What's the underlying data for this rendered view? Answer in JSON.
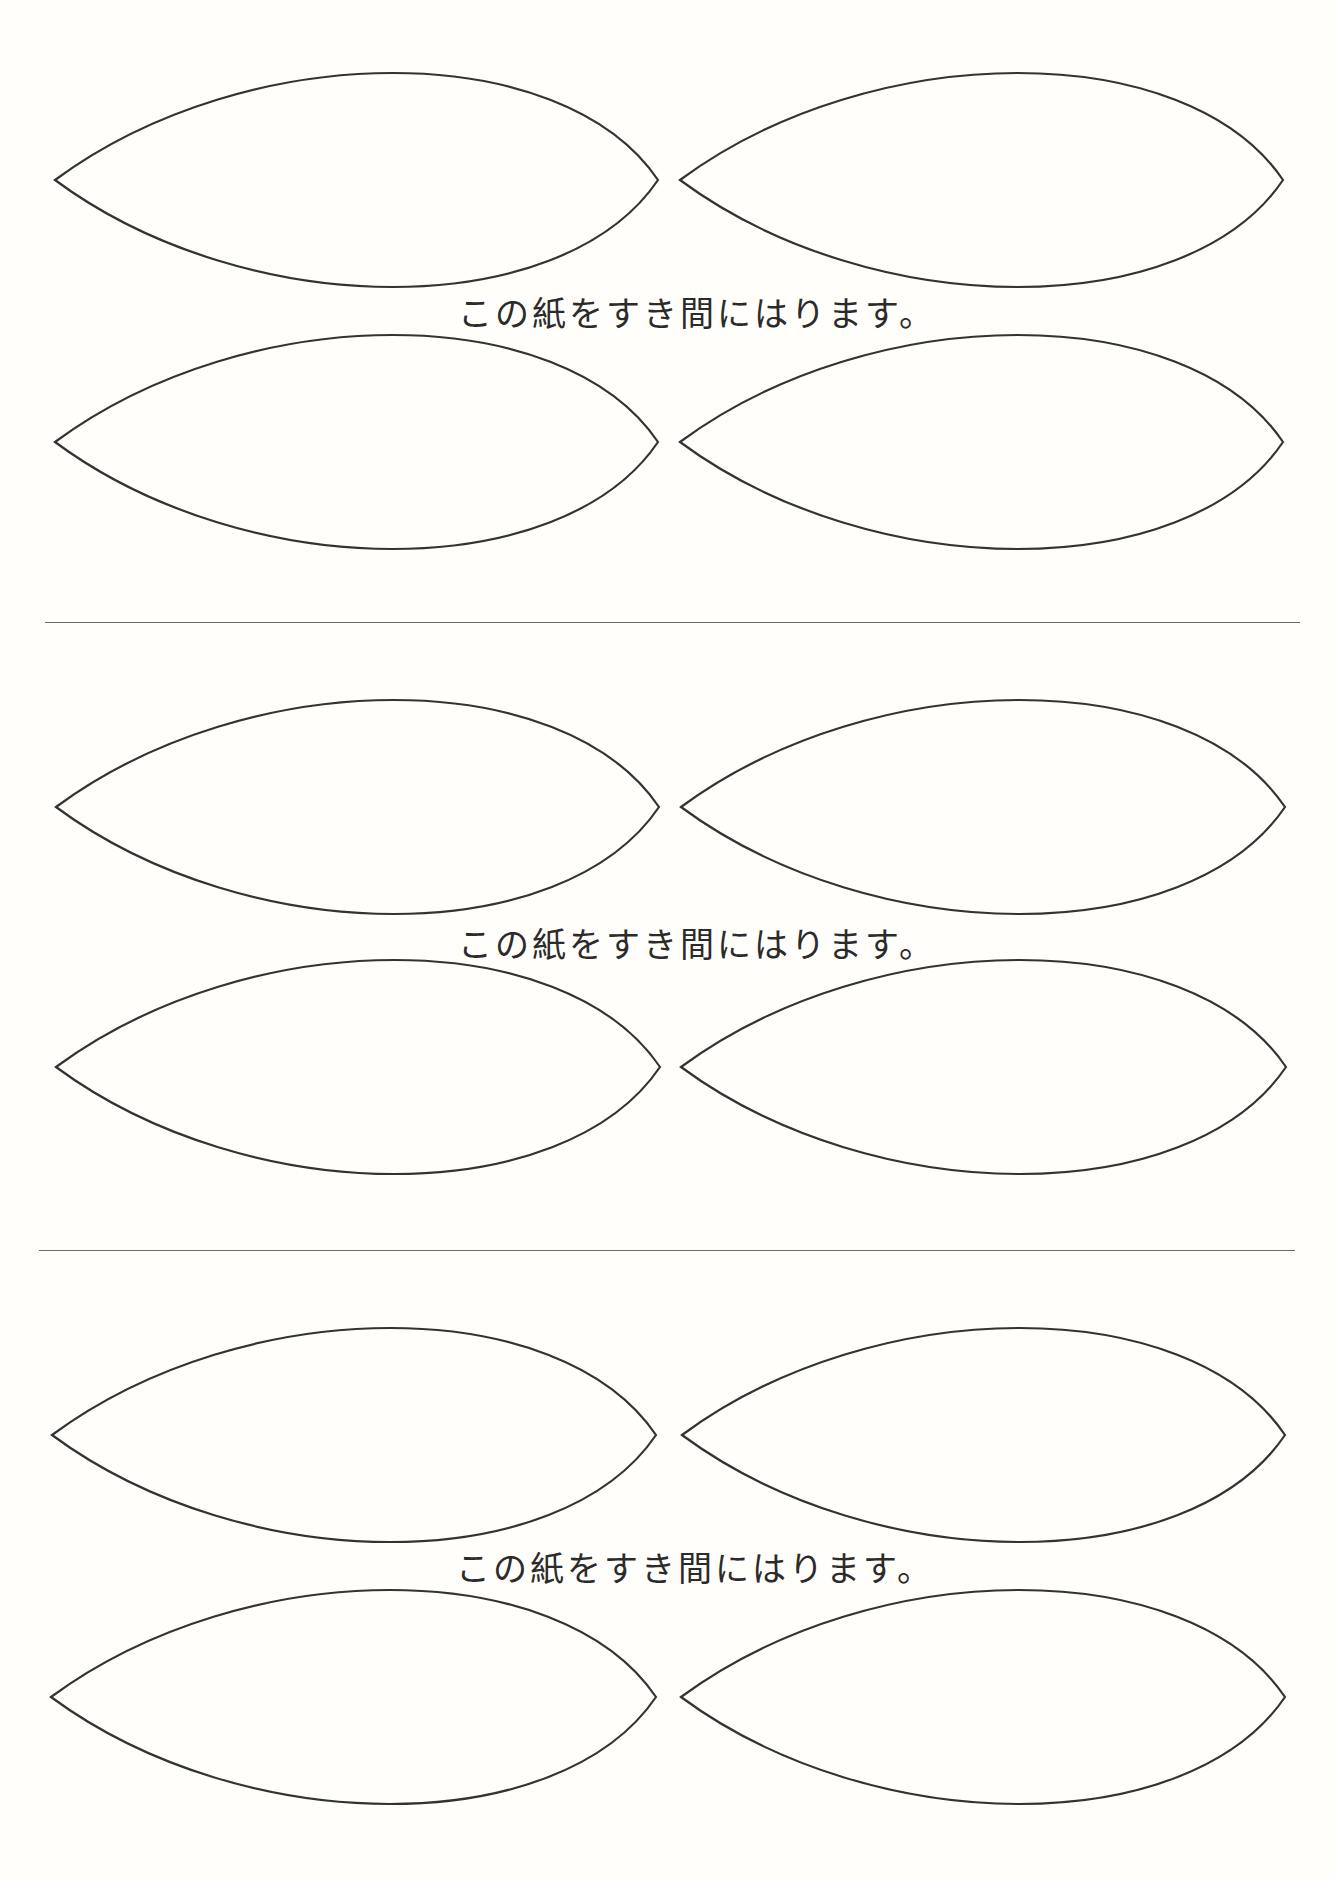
{
  "page": {
    "background": "#fffefa",
    "stroke_color": "#333333",
    "divider_color": "#6a6a6a"
  },
  "leaf_shape": {
    "width": 603,
    "half_height": 107,
    "peak_offset_ratio": 0.56
  },
  "sections": [
    {
      "caption": "この紙をすき間にはります。",
      "caption_x": 458,
      "caption_y": 296,
      "rows": [
        {
          "tip_y": 180,
          "leaves": [
            {
              "x0": 55,
              "x1": 658
            },
            {
              "x0": 680,
              "x1": 1283
            }
          ]
        },
        {
          "tip_y": 442,
          "leaves": [
            {
              "x0": 55,
              "x1": 658
            },
            {
              "x0": 680,
              "x1": 1283
            }
          ]
        }
      ]
    },
    {
      "caption": "この紙をすき間にはります。",
      "caption_x": 458,
      "caption_y": 927,
      "rows": [
        {
          "tip_y": 807,
          "leaves": [
            {
              "x0": 56,
              "x1": 659
            },
            {
              "x0": 681,
              "x1": 1285
            }
          ]
        },
        {
          "tip_y": 1067,
          "leaves": [
            {
              "x0": 56,
              "x1": 660
            },
            {
              "x0": 681,
              "x1": 1286
            }
          ]
        }
      ]
    },
    {
      "caption": "この紙をすき間にはります。",
      "caption_x": 456,
      "caption_y": 1551,
      "rows": [
        {
          "tip_y": 1435,
          "leaves": [
            {
              "x0": 52,
              "x1": 656
            },
            {
              "x0": 682,
              "x1": 1285
            }
          ]
        },
        {
          "tip_y": 1697,
          "leaves": [
            {
              "x0": 51,
              "x1": 656
            },
            {
              "x0": 681,
              "x1": 1285
            }
          ]
        }
      ]
    }
  ],
  "dividers": [
    {
      "x0": 45,
      "x1": 1300,
      "y": 622
    },
    {
      "x0": 39,
      "x1": 1295,
      "y": 1250
    }
  ]
}
